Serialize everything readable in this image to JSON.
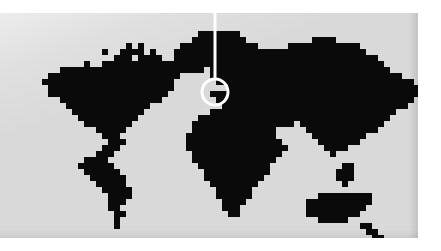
{
  "graphic": {
    "kind": "world-locator-map",
    "title": "World map with highlighted location",
    "style": "pixelated mosaic",
    "canvas": {
      "width": 441,
      "height": 251
    },
    "panel": {
      "x": 0,
      "y": 13,
      "width": 418,
      "height": 225
    },
    "colors": {
      "page_background": "#ffffff",
      "ocean_background": "#dcdcdc",
      "landmass": "#0a0a0a",
      "marker": "#ffffff"
    },
    "grid": {
      "cell_size": 6,
      "columns": 70,
      "rows": 38
    }
  },
  "marker": {
    "name": "location-highlight",
    "shape": "circle-outline",
    "center_x": 215,
    "center_y": 92,
    "radius": 13,
    "stroke_width": 3,
    "color": "#ffffff",
    "region_highlighted": "Western Europe / Iberian Peninsula"
  },
  "leader": {
    "name": "callout-line",
    "orientation": "vertical",
    "x": 215,
    "y_top": 0,
    "y_bottom": 79,
    "stroke_width": 3,
    "color": "#ffffff"
  },
  "landmasses": [
    {
      "name": "North America"
    },
    {
      "name": "Greenland"
    },
    {
      "name": "South America"
    },
    {
      "name": "Europe"
    },
    {
      "name": "Africa"
    },
    {
      "name": "Asia"
    },
    {
      "name": "Australia"
    },
    {
      "name": "Madagascar"
    },
    {
      "name": "New Zealand"
    },
    {
      "name": "Indonesia"
    },
    {
      "name": "Japan"
    },
    {
      "name": "British Isles"
    }
  ],
  "land_rows": [
    "0000000000000000000000000000000000000000000000000000000000000000000000",
    "0000000000000000000000000000000000000000000000000000000000000000000000",
    "0000000000000000000000000000000000000000000000000000000000000000000000",
    "0000000000000000000000000000000001111111000000000000000000000000000000",
    "0000000000000000000000000000000011111111100000000000111100000000000000",
    "0000000000000000000001010000001111111111111000001111111111110000000000",
    "0000000000000000010011110100011111111111111111111111111111111000000000",
    "0000000000000000000111011110011111111111111111111111111111111110000000",
    "0000000000000010011111111111111111111111111111111111111111111111000000",
    "0000000000111111111111111111111111011111111111111111111111111111100000",
    "0000000011111111111111111111110000011111111111111111111111111111111000",
    "0000000111111111111111111111100000001111111111111111111111111111111110",
    "0000000011111111111111111111100000000011111111111111111111111111111111",
    "0000000011111111111111111111000000011111111111111111111111111111111111",
    "0000000000111111111111111110000000001111111111111111111111111111111110",
    "0000000000011111111111111000000000000111111111111111111111111111111100",
    "0000000000001111111111110000000000011111111111111111111111111111110000",
    "0000000000000111111111100000000001111111111111111111111111111111100000",
    "0000000000000011111111000000000011111111111111111011111111111111000000",
    "0000000000000000111110000000000011111111111111000001111111111110000000",
    "0000000000000000011100000000000111111111111111000000111111111000000000",
    "0000000000000000001110000000000111111111111111100000011111110000000000",
    "0000000000000000011100000000000111111111111111110000001111000000000000",
    "0000000000000000111000000000000011111111111111100000000100000000000000",
    "0000000000000011110000000000000011111111111111000000000000000000000000",
    "0000000000000111111000000000000001111111111110000000000001100000000000",
    "0000000000000011111100000000000000111111111110000000000011100000000000",
    "0000000000000001111110000000000000111111111100000000000011100000000000",
    "0000000000000000111110000000000000011111111000000000000001000000000000",
    "0000000000000000011111000000000000001111110000000000000000000000000000",
    "0000000000000000001111000000000000001111110000000000011111111100000000",
    "0000000000000000001110000000000000000111100000000001111111111100000000",
    "0000000000000000001100000000000000000111000000000001111111111000000000",
    "0000000000000000000110000000000000000011000000000001111111110000000000",
    "0000000000000000000100000000000000000000000000000000011111000000000000",
    "0000000000000000000100000000000000000000000000000000000000001100000000",
    "0000000000000000000000000000000000000000000000000000000000000110000000",
    "0000000000000000000000000000000000000000000000000000000000000011000000"
  ]
}
